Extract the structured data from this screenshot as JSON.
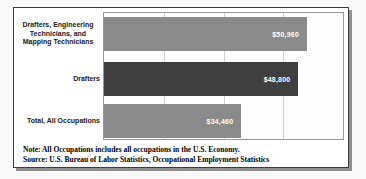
{
  "chart_data": {
    "type": "bar",
    "orientation": "horizontal",
    "title": "",
    "xlabel": "",
    "ylabel": "",
    "xlim": [
      0,
      60000
    ],
    "gridline_interval": 15000,
    "grid": true,
    "axis_tick_labels_shown": false,
    "categories": [
      "Drafters, Engineering Technicians, and Mapping Technicians",
      "Drafters",
      "Total, All Occupations"
    ],
    "values": [
      50960,
      48800,
      34460
    ],
    "rows": [
      {
        "label": "Drafters, Engineering Technicians, and Mapping Technicians",
        "label_display": "Drafters, Engineering\nTechnicians, and\nMapping Technicians",
        "value": 50960,
        "value_label": "$50,960",
        "color": "#8a8a8a"
      },
      {
        "label": "Drafters",
        "label_display": "Drafters",
        "value": 48800,
        "value_label": "$48,800",
        "color": "#3f3f3f"
      },
      {
        "label": "Total, All Occupations",
        "label_display": "Total, All Occupations",
        "value": 34460,
        "value_label": "$34,460",
        "color": "#8a8a8a"
      }
    ]
  },
  "notes": {
    "note": "Note: All Occupations includes all occupations in the U.S. Economy.",
    "source": "Source: U.S. Bureau of Labor Statistics, Occupational Employment Statistics"
  },
  "colors": {
    "bar_default": "#8a8a8a",
    "bar_highlight": "#3f3f3f",
    "value_text": "#ffffff",
    "plot_border": "#9a9a9a",
    "gridline": "#cfcfcf",
    "box_border": "#3c3c3c",
    "box_background": "#ffffff"
  }
}
